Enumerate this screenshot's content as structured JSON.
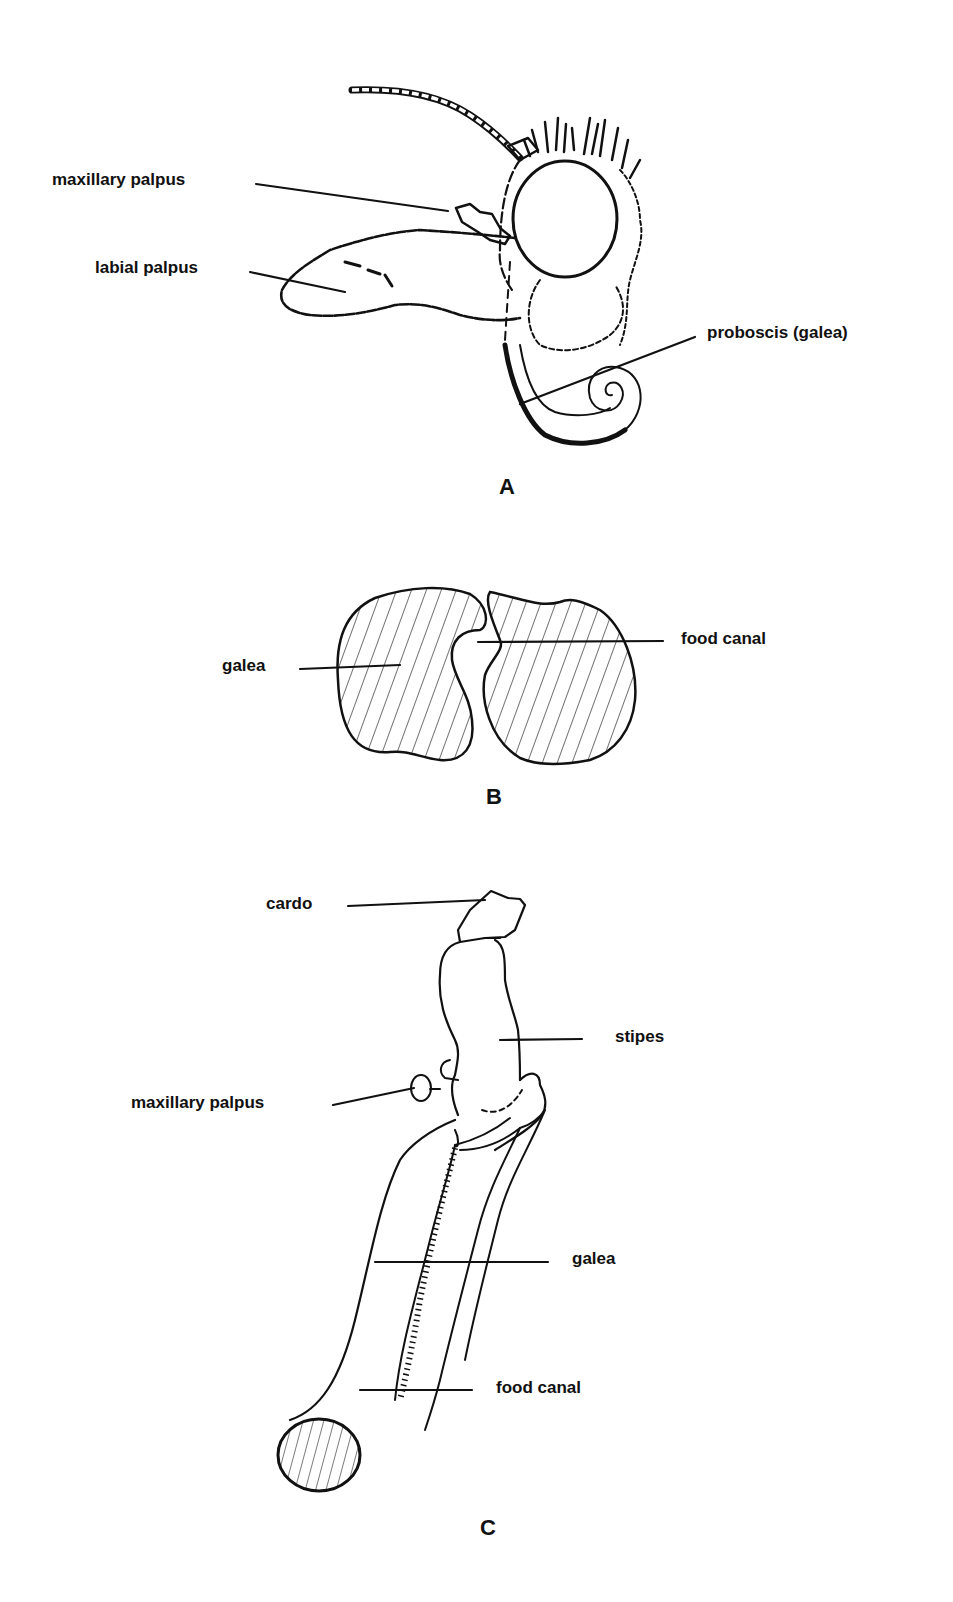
{
  "figure": {
    "panels": [
      {
        "id": "A",
        "letter": "A",
        "description": "Lateral view of moth head",
        "labels": {
          "maxillary_palpus": "maxillary palpus",
          "labial_palpus": "labial palpus",
          "proboscis": "proboscis (galea)"
        }
      },
      {
        "id": "B",
        "letter": "B",
        "description": "Cross-section of proboscis",
        "labels": {
          "galea": "galea",
          "food_canal": "food canal"
        }
      },
      {
        "id": "C",
        "letter": "C",
        "description": "Maxilla with elongated galea",
        "labels": {
          "cardo": "cardo",
          "stipes": "stipes",
          "maxillary_palpus": "maxillary palpus",
          "galea": "galea",
          "food_canal": "food canal"
        }
      }
    ],
    "colors": {
      "ink": "#111111",
      "background": "#ffffff"
    }
  }
}
